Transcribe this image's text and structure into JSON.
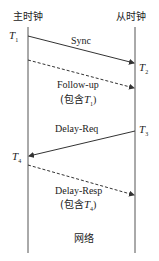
{
  "diagram": {
    "master_label": "主时钟",
    "slave_label": "从时钟",
    "network_label": "网络",
    "timestamps": {
      "t1": {
        "main": "T",
        "sub": "1"
      },
      "t2": {
        "main": "T",
        "sub": "2"
      },
      "t3": {
        "main": "T",
        "sub": "3"
      },
      "t4": {
        "main": "T",
        "sub": "4"
      }
    },
    "messages": [
      {
        "label": "Sync",
        "sub_label": "",
        "direction": "master-to-slave",
        "style": "solid"
      },
      {
        "label": "Follow-up",
        "sub_label_prefix": "(包含",
        "sub_label_t": "T",
        "sub_label_sub": "1",
        "sub_label_suffix": ")",
        "direction": "master-to-slave",
        "style": "dashed"
      },
      {
        "label": "Delay-Req",
        "sub_label": "",
        "direction": "slave-to-master",
        "style": "solid"
      },
      {
        "label": "Delay-Resp",
        "sub_label_prefix": "(包含",
        "sub_label_t": "T",
        "sub_label_sub": "4",
        "sub_label_suffix": ")",
        "direction": "master-to-slave",
        "style": "dashed"
      }
    ],
    "colors": {
      "line": "#333333",
      "background": "#ffffff"
    }
  }
}
